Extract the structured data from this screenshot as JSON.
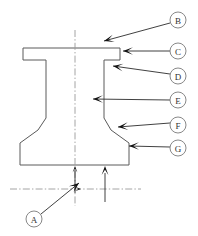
{
  "figure": {
    "background_color": "#ffffff",
    "outline_color": "#5a5a5a",
    "leader_color": "#2b2b2b",
    "centerline_color": "#9a9a9a",
    "callout_text_color": "#333333",
    "width": 198,
    "height": 236
  },
  "callouts": [
    {
      "id": "A",
      "label": "A",
      "circle": {
        "cx": 34,
        "cy": 219,
        "r": 8
      },
      "leader": {
        "x1": 41,
        "y1": 214,
        "x2": 79,
        "y2": 183
      },
      "arrow": {
        "x": 79,
        "y": 183,
        "angle": -39
      }
    },
    {
      "id": "B",
      "label": "B",
      "circle": {
        "cx": 178,
        "cy": 20,
        "r": 8
      },
      "leader": {
        "x1": 170,
        "y1": 23,
        "x2": 104,
        "y2": 41
      },
      "arrow": {
        "x": 104,
        "y": 41,
        "angle": 165
      }
    },
    {
      "id": "C",
      "label": "C",
      "circle": {
        "cx": 178,
        "cy": 51,
        "r": 8
      },
      "leader": {
        "x1": 170,
        "y1": 51,
        "x2": 123,
        "y2": 51
      },
      "arrow": {
        "x": 123,
        "y": 51,
        "angle": 180
      }
    },
    {
      "id": "D",
      "label": "D",
      "circle": {
        "cx": 178,
        "cy": 76,
        "r": 8
      },
      "leader": {
        "x1": 170,
        "y1": 74,
        "x2": 113,
        "y2": 66
      },
      "arrow": {
        "x": 113,
        "y": 66,
        "angle": 188
      }
    },
    {
      "id": "E",
      "label": "E",
      "circle": {
        "cx": 178,
        "cy": 100,
        "r": 8
      },
      "leader": {
        "x1": 170,
        "y1": 100,
        "x2": 93,
        "y2": 99
      },
      "arrow": {
        "x": 93,
        "y": 99,
        "angle": 180
      }
    },
    {
      "id": "F",
      "label": "F",
      "circle": {
        "cx": 178,
        "cy": 125,
        "r": 8
      },
      "leader": {
        "x1": 170,
        "y1": 123,
        "x2": 118,
        "y2": 127
      },
      "arrow": {
        "x": 118,
        "y": 127,
        "angle": 175
      }
    },
    {
      "id": "G",
      "label": "G",
      "circle": {
        "cx": 178,
        "cy": 148,
        "r": 8
      },
      "leader": {
        "x1": 170,
        "y1": 147,
        "x2": 129,
        "y2": 146
      },
      "arrow": {
        "x": 129,
        "y": 146,
        "angle": 180
      }
    }
  ],
  "geometry": {
    "profile_path": "M 23 48 L 23 60 L 35 60 L 46 60 L 46 72 L 46 118 L 38 130 L 20 143 L 20 165 L 129 165 L 129 143 L 111 130 L 104 118 L 104 72 L 104 60 L 120 60 L 120 48 Z",
    "centerline_vertical": {
      "x": 75,
      "y1": 30,
      "y2": 206
    },
    "centerline_horizontal": {
      "y": 189,
      "x1": 10,
      "x2": 141
    }
  },
  "dimension_arrows": [
    {
      "name": "height-arrow",
      "x": 75,
      "y_tip": 166,
      "y_tail": 193,
      "direction": "up"
    },
    {
      "name": "flange-height-arrow",
      "x": 105,
      "y_tip": 166,
      "y_tail": 202,
      "direction": "up"
    },
    {
      "name": "datum-right-arrow",
      "x_tip": 81,
      "y": 189,
      "x_tail": 75,
      "direction": "right"
    }
  ]
}
